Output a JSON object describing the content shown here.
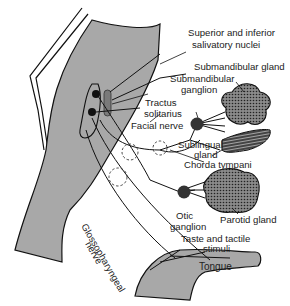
{
  "diagram": {
    "colors": {
      "tissue": "#a8a8a8",
      "line": "#111111",
      "ganglion": "#333333",
      "nucleus_bar": "#7a7a7a",
      "background": "#ffffff"
    },
    "labels": {
      "salivatory_nuclei_1": "Superior and inferior",
      "salivatory_nuclei_2": "salivatory nuclei",
      "submandibular_gland": "Submandibular gland",
      "submandibular_ganglion_1": "Submandibular",
      "submandibular_ganglion_2": "ganglion",
      "tractus_1": "Tractus",
      "tractus_2": "solitarius",
      "facial_nerve": "Facial nerve",
      "sublingual_1": "Sublingual",
      "sublingual_2": "gland",
      "chorda_tympani": "Chorda tympani",
      "otic_1": "Otic",
      "otic_2": "ganglion",
      "parotid_gland": "Parotid gland",
      "glossopharyngeal_1": "Glossopharyngeal",
      "glossopharyngeal_2": "nerve",
      "taste_1": "Taste and tactile",
      "taste_2": "stimuli",
      "tongue": "Tongue"
    }
  }
}
